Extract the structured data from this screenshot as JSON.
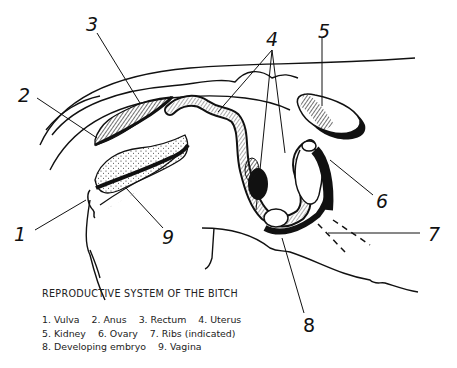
{
  "figure": {
    "title": "REPRODUCTIVE SYSTEM OF THE BITCH",
    "labels": [
      {
        "num": "1",
        "name": "Vulva"
      },
      {
        "num": "2",
        "name": "Anus"
      },
      {
        "num": "3",
        "name": "Rectum"
      },
      {
        "num": "4",
        "name": "Uterus"
      },
      {
        "num": "5",
        "name": "Kidney"
      },
      {
        "num": "6",
        "name": "Ovary"
      },
      {
        "num": "7",
        "name": "Ribs (indicated)"
      },
      {
        "num": "8",
        "name": "Developing embryo"
      },
      {
        "num": "9",
        "name": "Vagina"
      }
    ],
    "legend_lines": [
      [
        "1. Vulva",
        "2. Anus",
        "3. Rectum",
        "4. Uterus"
      ],
      [
        "5. Kidney",
        "6. Ovary",
        "7. Ribs (indicated)"
      ],
      [
        "8. Developing embryo",
        "9. Vagina"
      ]
    ]
  }
}
